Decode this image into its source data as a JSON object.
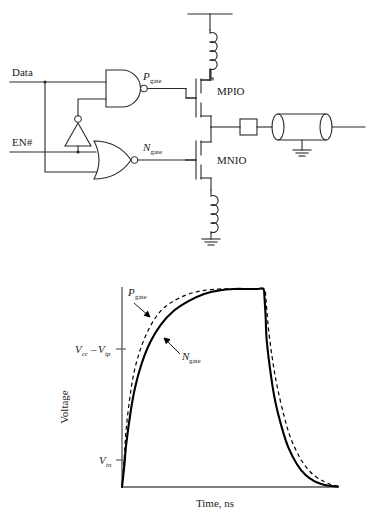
{
  "figure": {
    "kind": "two-panel-figure",
    "panels": [
      "cmos-io-driver-schematic",
      "gate-voltage-waveform-plot"
    ]
  },
  "schematic": {
    "title": "",
    "inputs": [
      {
        "name": "data-input",
        "label": "Data"
      },
      {
        "name": "enable-input",
        "label": "EN#"
      }
    ],
    "gates": [
      {
        "name": "nand-gate",
        "type": "NAND",
        "inputs": [
          "Data",
          "EN#-inverted"
        ],
        "output": "P_gate"
      },
      {
        "name": "inverter-gate",
        "type": "INV",
        "inputs": [
          "EN#"
        ],
        "output": "EN#-inverted"
      },
      {
        "name": "nor-gate",
        "type": "NOR",
        "inputs": [
          "Data",
          "EN#"
        ],
        "output": "N_gate"
      }
    ],
    "nets": [
      {
        "name": "p-gate-net",
        "label": "P",
        "sub": "gate"
      },
      {
        "name": "n-gate-net",
        "label": "N",
        "sub": "gate"
      }
    ],
    "transistors": [
      {
        "name": "pmos-output-transistor",
        "label": "MPIO"
      },
      {
        "name": "nmos-output-transistor",
        "label": "MNIO"
      }
    ],
    "passives": [
      {
        "name": "vcc-lead-inductor",
        "type": "inductor"
      },
      {
        "name": "gnd-lead-inductor",
        "type": "inductor"
      },
      {
        "name": "series-resistor",
        "type": "resistor"
      },
      {
        "name": "transmission-line",
        "type": "transmission-line"
      },
      {
        "name": "load-ground",
        "type": "ground"
      },
      {
        "name": "supply-rail",
        "type": "vcc-rail"
      },
      {
        "name": "bottom-ground",
        "type": "ground"
      }
    ]
  },
  "chart_data": {
    "type": "line",
    "title": "",
    "xlabel": "Time, ns",
    "ylabel": "Voltage",
    "grid": false,
    "legend": "inline-annotations",
    "xlim": [
      0,
      1
    ],
    "ylim": [
      0,
      1
    ],
    "xticks": [],
    "yticks": [
      {
        "label": "V_cc-V_tp",
        "value": 0.69
      },
      {
        "label": "V_tn",
        "value": 0.135
      }
    ],
    "ytick_labels": [
      {
        "name": "vcc-minus-vtp-tick",
        "main1": "V",
        "sub1": "cc",
        "op": "–",
        "main2": "V",
        "sub2": "tp"
      },
      {
        "name": "vtn-tick",
        "main1": "V",
        "sub1": "tn"
      }
    ],
    "annotations": [
      {
        "name": "p-gate-annotation",
        "main": "P",
        "sub": "gate",
        "points_to_series": "P_gate"
      },
      {
        "name": "n-gate-annotation",
        "main": "N",
        "sub": "gate",
        "points_to_series": "N_gate"
      }
    ],
    "series": [
      {
        "name": "P_gate",
        "style": "dashed",
        "x": [
          0.0,
          0.01,
          0.02,
          0.04,
          0.06,
          0.09,
          0.13,
          0.18,
          0.24,
          0.31,
          0.38,
          0.45,
          0.52,
          0.58,
          0.63,
          0.66,
          0.665,
          0.67,
          0.68,
          0.7,
          0.72,
          0.75,
          0.78,
          0.82,
          0.86,
          0.9,
          0.94,
          0.97,
          1.0
        ],
        "values": [
          0.0,
          0.14,
          0.3,
          0.48,
          0.6,
          0.71,
          0.81,
          0.89,
          0.94,
          0.975,
          0.993,
          1.0,
          1.0,
          1.0,
          1.0,
          1.0,
          0.97,
          0.9,
          0.78,
          0.62,
          0.5,
          0.36,
          0.25,
          0.155,
          0.09,
          0.05,
          0.025,
          0.012,
          0.005
        ]
      },
      {
        "name": "N_gate",
        "style": "solid",
        "x": [
          0.0,
          0.01,
          0.02,
          0.04,
          0.06,
          0.09,
          0.13,
          0.18,
          0.24,
          0.31,
          0.38,
          0.45,
          0.52,
          0.58,
          0.63,
          0.655,
          0.66,
          0.665,
          0.67,
          0.69,
          0.71,
          0.74,
          0.77,
          0.81,
          0.85,
          0.89,
          0.93,
          0.96,
          1.0
        ],
        "values": [
          0.0,
          0.1,
          0.22,
          0.38,
          0.5,
          0.62,
          0.73,
          0.82,
          0.89,
          0.94,
          0.975,
          0.993,
          1.0,
          1.0,
          1.0,
          1.0,
          0.95,
          0.86,
          0.74,
          0.56,
          0.43,
          0.3,
          0.2,
          0.115,
          0.06,
          0.03,
          0.013,
          0.006,
          0.002
        ]
      }
    ]
  }
}
